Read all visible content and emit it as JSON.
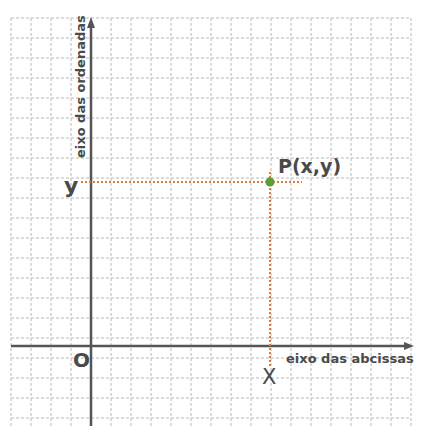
{
  "diagram": {
    "type": "cartesian-plane",
    "grid": {
      "spacing_px": 20,
      "line_color": "#b5b5b5",
      "style": "dashed"
    },
    "axes": {
      "x_label": "eixo das abcissas",
      "y_label": "eixo das ordenadas",
      "origin_label": "O",
      "color": "#555555"
    },
    "point": {
      "label": "P(x,y)",
      "x_label": "X",
      "y_label": "y",
      "color": "#5a9e3a",
      "guide_color": "#e07a3a"
    }
  }
}
